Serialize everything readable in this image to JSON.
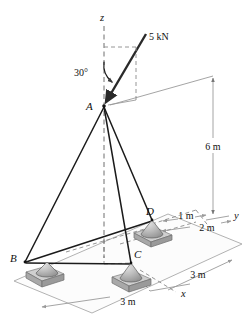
{
  "figure": {
    "type": "engineering-diagram",
    "canvas": {
      "width": 247,
      "height": 323
    }
  },
  "colors": {
    "member": "#1b1b1b",
    "force": "#2a2a2a",
    "axis_dash": "#6f6f6f",
    "dimension": "#9a9a9a",
    "ground": "#a9a9a9",
    "plate_top": "#cfcfcf",
    "plate_front": "#a8a8a8",
    "background": "#ffffff"
  },
  "joints": [
    {
      "id": "A",
      "label": "A",
      "x": 104,
      "y": 106,
      "role": "apex"
    },
    {
      "id": "B",
      "label": "B",
      "x": 24,
      "y": 262,
      "role": "support"
    },
    {
      "id": "C",
      "label": "C",
      "x": 132,
      "y": 263,
      "role": "support"
    },
    {
      "id": "D",
      "label": "D",
      "x": 153,
      "y": 219,
      "role": "support"
    }
  ],
  "members": [
    {
      "from": "A",
      "to": "B"
    },
    {
      "from": "A",
      "to": "C"
    },
    {
      "from": "A",
      "to": "D"
    },
    {
      "from": "B",
      "to": "C"
    },
    {
      "from": "B",
      "to": "D"
    }
  ],
  "load": {
    "magnitude_label": "5 kN",
    "angle_label": "30°",
    "applied_at": "A",
    "direction": "downward toward A, inclined 30° from z-axis"
  },
  "axes": [
    {
      "name": "z",
      "label": "z",
      "label_x": 103,
      "label_y": 21
    },
    {
      "name": "y",
      "label": "y",
      "label_x": 236,
      "label_y": 219
    },
    {
      "name": "x",
      "label": "x",
      "label_x": 181,
      "label_y": 297
    }
  ],
  "dimensions": [
    {
      "id": "height",
      "label": "6 m",
      "label_x": 213,
      "label_y": 147,
      "orientation": "vertical",
      "measures": "A above base plane"
    },
    {
      "id": "d-offset-1",
      "label": "1 m",
      "label_x": 186,
      "label_y": 218,
      "orientation": "oblique",
      "measures": "D offset along y"
    },
    {
      "id": "d-offset-2",
      "label": "2 m",
      "label_x": 207,
      "label_y": 231,
      "orientation": "oblique",
      "measures": "D offset along y"
    },
    {
      "id": "base-right",
      "label": "3 m",
      "label_x": 198,
      "label_y": 278,
      "orientation": "oblique",
      "measures": "base width along y"
    },
    {
      "id": "base-front",
      "label": "3 m",
      "label_x": 128,
      "label_y": 305,
      "orientation": "oblique",
      "measures": "base width along x"
    }
  ]
}
